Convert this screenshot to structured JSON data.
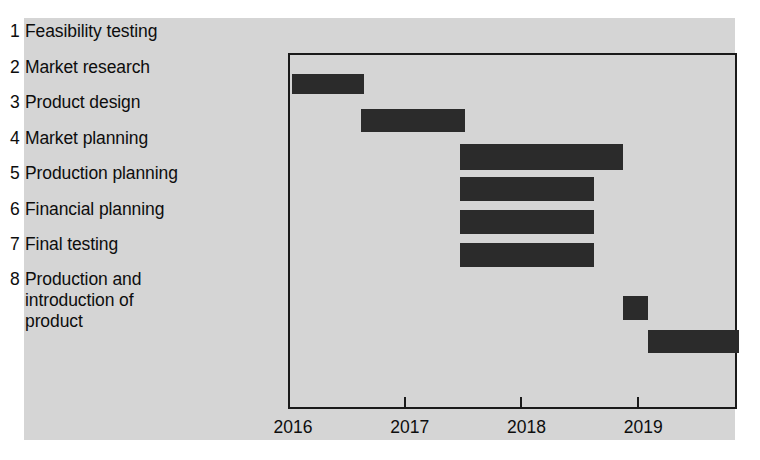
{
  "chart_data": {
    "type": "bar",
    "chart_style": "gantt",
    "title": "",
    "xlabel": "",
    "ylabel": "",
    "xlim": [
      2016,
      2019.846
    ],
    "xticks": [
      2016,
      2017,
      2018,
      2019
    ],
    "xtick_labels": [
      "2016",
      "2017",
      "2018",
      "2019"
    ],
    "grid": false,
    "legend": null,
    "bar_color": "#2b2b2b",
    "background_color": "#d5d5d5",
    "frame_color": "#1a1a1a",
    "categories": [
      "Feasibility testing",
      "Market research",
      "Product design",
      "Market planning",
      "Production planning",
      "Financial planning",
      "Final testing",
      "Production and introduction of product"
    ],
    "tasks": [
      {
        "number": "1",
        "name": "Feasibility testing",
        "start": 2016.02,
        "end": 2016.63
      },
      {
        "number": "2",
        "name": "Market research",
        "start": 2016.61,
        "end": 2017.5
      },
      {
        "number": "3",
        "name": "Product design",
        "start": 2017.46,
        "end": 2018.85
      },
      {
        "number": "4",
        "name": "Market planning",
        "start": 2017.46,
        "end": 2018.6
      },
      {
        "number": "5",
        "name": "Production planning",
        "start": 2017.46,
        "end": 2018.6
      },
      {
        "number": "6",
        "name": "Financial planning",
        "start": 2017.46,
        "end": 2018.6
      },
      {
        "number": "7",
        "name": "Final testing",
        "start": 2018.85,
        "end": 2019.07
      },
      {
        "number": "8",
        "name": "Production and introduction of product",
        "start": 2019.07,
        "end": 2019.846
      }
    ],
    "durations_years": [
      0.61,
      0.89,
      1.39,
      1.14,
      1.14,
      1.14,
      0.22,
      0.78
    ]
  },
  "labels": {
    "tasks": [
      {
        "number": "1",
        "text": "Feasibility testing"
      },
      {
        "number": "2",
        "text": "Market research"
      },
      {
        "number": "3",
        "text": "Product design"
      },
      {
        "number": "4",
        "text": "Market planning"
      },
      {
        "number": "5",
        "text": "Production planning"
      },
      {
        "number": "6",
        "text": "Financial planning"
      },
      {
        "number": "7",
        "text": "Final testing"
      },
      {
        "number": "8",
        "text": "Production and\nintroduction of\nproduct"
      }
    ],
    "years": [
      "2016",
      "2017",
      "2018",
      "2019"
    ]
  }
}
